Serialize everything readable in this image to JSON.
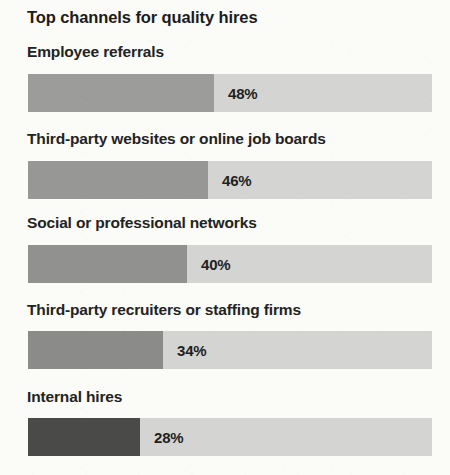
{
  "chart_data": {
    "type": "bar",
    "title": "Top channels for quality hires",
    "xlabel": "",
    "ylabel": "",
    "orientation": "horizontal",
    "grid": false,
    "legend": false,
    "xlim": [
      0,
      100
    ],
    "value_suffix": "%",
    "track_color": "#d4d4d2",
    "background_color": "#fbfbf8",
    "title_color": "#1c1c1c",
    "label_color": "#232323",
    "value_color": "#1f1f1f",
    "categories": [
      "Employee referrals",
      "Third-party websites or online job boards",
      "Social or professional networks",
      "Third-party recruiters or staffing firms",
      "Internal hires"
    ],
    "values": [
      48,
      46,
      40,
      34,
      28
    ],
    "value_labels": [
      "48%",
      "46%",
      "40%",
      "34%",
      "28%"
    ],
    "bar_colors": [
      "#9c9c9a",
      "#979795",
      "#919190",
      "#8b8b8a",
      "#4a4a49"
    ],
    "bar_fill_widths_px": [
      186,
      180,
      159,
      135,
      112
    ],
    "rows": [
      {
        "label": "Employee referrals",
        "value": 48,
        "value_label": "48%",
        "color": "#9c9c9a",
        "fill_px": 186,
        "label_top": 43,
        "bar_top": 74
      },
      {
        "label": "Third-party websites or online job boards",
        "value": 46,
        "value_label": "46%",
        "color": "#979795",
        "fill_px": 180,
        "label_top": 130,
        "bar_top": 161
      },
      {
        "label": "Social or professional networks",
        "value": 40,
        "value_label": "40%",
        "color": "#919190",
        "fill_px": 159,
        "label_top": 214,
        "bar_top": 245
      },
      {
        "label": "Third-party recruiters or staffing firms",
        "value": 34,
        "value_label": "34%",
        "color": "#8b8b8a",
        "fill_px": 135,
        "label_top": 301,
        "bar_top": 331
      },
      {
        "label": "Internal hires",
        "value": 28,
        "value_label": "28%",
        "color": "#4a4a49",
        "fill_px": 112,
        "label_top": 388,
        "bar_top": 418
      }
    ]
  }
}
